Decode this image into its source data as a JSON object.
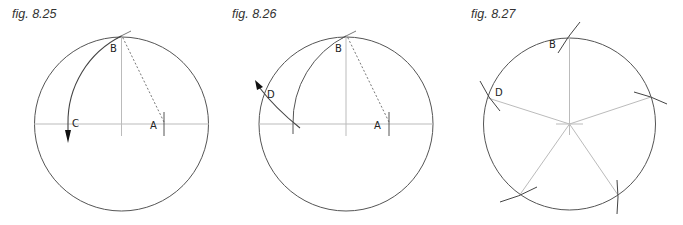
{
  "figures": [
    {
      "id": "fig-8-25",
      "caption": "fig. 8.25",
      "labels": {
        "B": "B",
        "C": "C",
        "A": "A"
      }
    },
    {
      "id": "fig-8-26",
      "caption": "fig. 8.26",
      "labels": {
        "B": "B",
        "D": "D",
        "A": "A"
      }
    },
    {
      "id": "fig-8-27",
      "caption": "fig. 8.27",
      "labels": {
        "B": "B",
        "D": "D"
      }
    }
  ],
  "colors": {
    "circle": "#555555",
    "construction_line": "#bbbbbb",
    "arc": "#444444",
    "arrow": "#111111",
    "caption": "#333333"
  }
}
